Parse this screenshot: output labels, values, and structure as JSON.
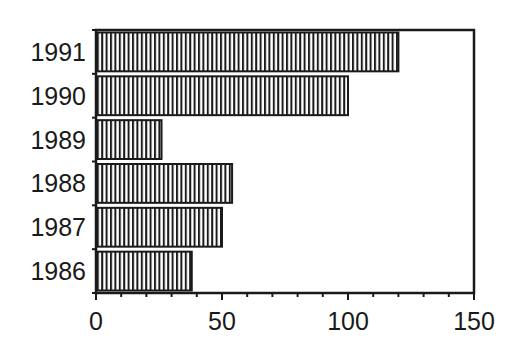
{
  "chart_data": {
    "type": "bar",
    "orientation": "horizontal",
    "title": "",
    "xlabel": "",
    "ylabel": "",
    "categories": [
      "1991",
      "1990",
      "1989",
      "1988",
      "1987",
      "1986"
    ],
    "values": [
      120,
      100,
      26,
      54,
      50,
      38
    ],
    "xlim": [
      0,
      150
    ],
    "x_ticks": [
      "0",
      "50",
      "100",
      "150"
    ],
    "x_minor_tick_step": 10,
    "grid": false,
    "legend": null,
    "bar_fill": "vertical-hatch",
    "colors": {
      "bar_stroke": "#1a1a1a",
      "hatch": "#1a1a1a",
      "background": "#ffffff",
      "axis": "#1a1a1a"
    }
  }
}
